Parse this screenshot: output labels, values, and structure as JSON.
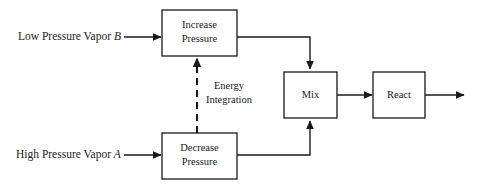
{
  "diagram": {
    "background_color": "#ffffff",
    "line_color": "#1a1a1a",
    "boxes": [
      {
        "id": "increase-pressure",
        "label_line1": "Increase",
        "label_line2": "Pressure"
      },
      {
        "id": "decrease-pressure",
        "label_line1": "Decrease",
        "label_line2": "Pressure"
      },
      {
        "id": "mix",
        "label_line1": "Mix",
        "label_line2": ""
      },
      {
        "id": "react",
        "label_line1": "React",
        "label_line2": ""
      }
    ],
    "streams": [
      {
        "id": "low-pressure-vapor-b",
        "text": "Low Pressure Vapor ",
        "variable": "B"
      },
      {
        "id": "high-pressure-vapor-a",
        "text": "High Pressure Vapor ",
        "variable": "A"
      }
    ],
    "annotations": [
      {
        "id": "energy-integration",
        "line1": "Energy",
        "line2": "Integration",
        "style": "dashed"
      }
    ]
  }
}
